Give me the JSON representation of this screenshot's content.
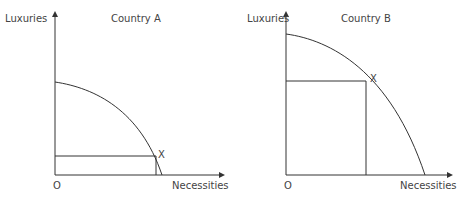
{
  "diagrams": [
    {
      "title": "Country A",
      "y_axis_label": "Luxuries",
      "x_axis_label": "Necessities",
      "origin_label": "O",
      "point_label": "X"
    },
    {
      "title": "Country B",
      "y_axis_label": "Luxuries",
      "x_axis_label": "Necessities",
      "origin_label": "O",
      "point_label": "X"
    }
  ]
}
